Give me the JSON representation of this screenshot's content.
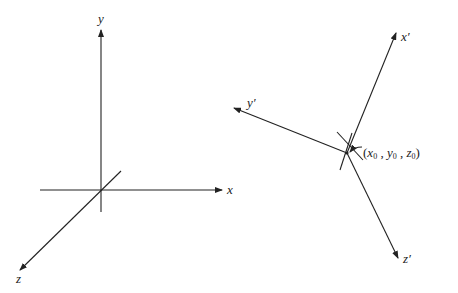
{
  "diagram": {
    "left_frame": {
      "origin": [
        101,
        190
      ],
      "axes": {
        "x": {
          "label": "x",
          "tip": [
            222,
            190
          ],
          "tail": [
            40,
            190
          ]
        },
        "y": {
          "label": "y",
          "tip": [
            101,
            30
          ],
          "tail": [
            101,
            212
          ]
        },
        "z": {
          "label": "z",
          "tip": [
            20,
            270
          ],
          "tail": [
            121,
            171
          ]
        }
      }
    },
    "right_frame": {
      "origin": [
        347,
        153
      ],
      "axes": {
        "x_prime": {
          "label": "x",
          "prime": "′",
          "tip": [
            396,
            33
          ],
          "tail": [
            347,
            153
          ]
        },
        "y_prime": {
          "label": "y",
          "prime": "′",
          "tip": [
            234,
            108
          ],
          "tail": [
            347,
            153
          ]
        },
        "z_prime": {
          "label": "z",
          "prime": "′",
          "tip": [
            398,
            258
          ],
          "tail": [
            347,
            153
          ]
        }
      },
      "origin_label": {
        "open": "(",
        "x": "x",
        "x_sub": "0",
        "sep1": " , ",
        "y": "y",
        "y_sub": "0",
        "sep2": " , ",
        "z": "z",
        "z_sub": "0",
        "close": ")"
      }
    },
    "colors": {
      "stroke": "#222222",
      "background": "#ffffff"
    }
  }
}
